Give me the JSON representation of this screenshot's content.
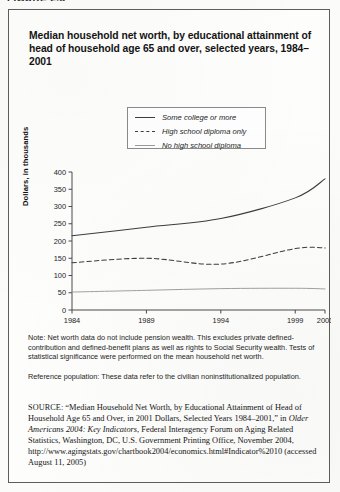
{
  "figure": {
    "caption_cut": "FIGURE 2.5"
  },
  "title": "Median household net worth, by educational attainment of head of household age 65 and over, selected years, 1984–2001",
  "legend": {
    "position": "inside-top-center",
    "items": [
      {
        "label": "Some college or more",
        "style": "solid-dark",
        "color": "#3c3c3c"
      },
      {
        "label": "High school diploma only",
        "style": "dashed",
        "color": "#3c3c3c"
      },
      {
        "label": "No high school diploma",
        "style": "solid-light",
        "color": "#9b9b9b"
      }
    ]
  },
  "chart_data": {
    "type": "line",
    "title": "Median household net worth, by educational attainment of head of household age 65 and over, selected years, 1984–2001",
    "xlabel": "",
    "ylabel": "Dollars, in thousands",
    "x": [
      1984,
      1989,
      1994,
      1999,
      2001
    ],
    "xtick_labels": [
      "1984",
      "1989",
      "1994",
      "1999",
      "2001"
    ],
    "ytick_labels": [
      "0",
      "50",
      "100",
      "150",
      "200",
      "250",
      "300",
      "350",
      "400"
    ],
    "yticks": [
      0,
      50,
      100,
      150,
      200,
      250,
      300,
      350,
      400
    ],
    "ylim": [
      0,
      400
    ],
    "xlim": [
      1984,
      2001
    ],
    "grid": false,
    "legend_position": "upper-center-inside",
    "series": [
      {
        "name": "Some college or more",
        "color": "#3c3c3c",
        "dash": "none",
        "values": [
          215,
          240,
          265,
          325,
          380
        ]
      },
      {
        "name": "High school diploma only",
        "color": "#3c3c3c",
        "dash": "dashed",
        "values": [
          137,
          150,
          133,
          178,
          180
        ]
      },
      {
        "name": "No high school diploma",
        "color": "#9b9b9b",
        "dash": "none",
        "values": [
          52,
          57,
          62,
          63,
          61
        ]
      }
    ]
  },
  "axis": {
    "y_title": "Dollars, in thousands"
  },
  "notes": {
    "note": "Note: Net worth data do not include pension wealth. This excludes private defined-contribution and defined-benefit plans as well as rights to Social Security wealth. Tests of statistical significance were performed on the mean household net worth.",
    "reference_population": "Reference population: These data refer to the civilian noninstitutionalized population."
  },
  "source": {
    "label": "SOURCE",
    "text_part1": ": “Median Household Net Worth, by Educational Attainment of Head of Household Age 65 and Over, in 2001 Dollars, Selected Years 1984–2001,” in ",
    "italic_title": "Older Americans 2004: Key Indicators",
    "text_part2": ", Federal Interagency Forum on Aging Related Statistics, Washington, DC, U.S. Government Printing Office, November 2004, http://www.agingstats.gov/chartbook2004/economics.html#Indicator%2010 (accessed August 11, 2005)"
  }
}
